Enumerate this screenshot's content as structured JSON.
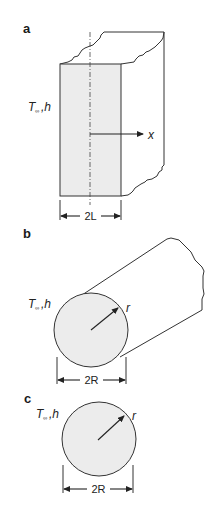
{
  "figure": {
    "panels": [
      {
        "id": "a",
        "label": "a",
        "shape": "slab",
        "boundary_label": {
          "main": "T",
          "subscript": "∞",
          "suffix": ",h"
        },
        "coordinate_label": "x",
        "dimension_label": "2L"
      },
      {
        "id": "b",
        "label": "b",
        "shape": "cylinder",
        "boundary_label": {
          "main": "T",
          "subscript": "∞",
          "suffix": ",h"
        },
        "radius_label": "r",
        "dimension_label": "2R"
      },
      {
        "id": "c",
        "label": "c",
        "shape": "sphere",
        "boundary_label": {
          "main": "T",
          "subscript": "∞",
          "suffix": ",h"
        },
        "radius_label": "r",
        "dimension_label": "2R"
      }
    ],
    "colors": {
      "fill": "#ececec",
      "stroke": "#333333",
      "background": "#ffffff"
    }
  }
}
